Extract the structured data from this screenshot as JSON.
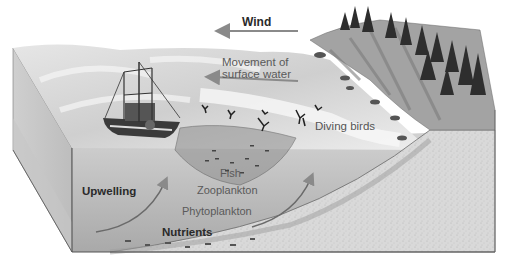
{
  "diagram": {
    "type": "cross-section illustration",
    "labels": {
      "wind": "Wind",
      "surface_water": "Movement of\nsurface water",
      "surface_water_line1": "Movement of",
      "surface_water_line2": "surface water",
      "diving_birds": "Diving birds",
      "fish": "Fish",
      "zooplankton": "Zooplankton",
      "phytoplankton": "Phytoplankton",
      "upwelling": "Upwelling",
      "nutrients": "Nutrients"
    },
    "arrows": [
      {
        "name": "wind-arrow",
        "direction": "left",
        "label": "Wind"
      },
      {
        "name": "surface-water-arrow",
        "direction": "left",
        "label": "Movement of surface water"
      },
      {
        "name": "upwelling-arrow-left",
        "direction": "up-right",
        "label": "Upwelling"
      },
      {
        "name": "upwelling-arrow-right",
        "direction": "up-right"
      }
    ],
    "elements": [
      "fishing boat with trawl net",
      "diving birds",
      "coastal cliff with conifer trees",
      "sloping seabed (continental shelf)",
      "ocean water block"
    ],
    "colors": {
      "arrow": "#8a8a8a",
      "water_surface": "#d8d8d8",
      "water_body": "#b9b9b9",
      "seabed": "#d6d6d6",
      "cliff": "#9a9a9a",
      "trees": "#2e2e2e"
    }
  }
}
